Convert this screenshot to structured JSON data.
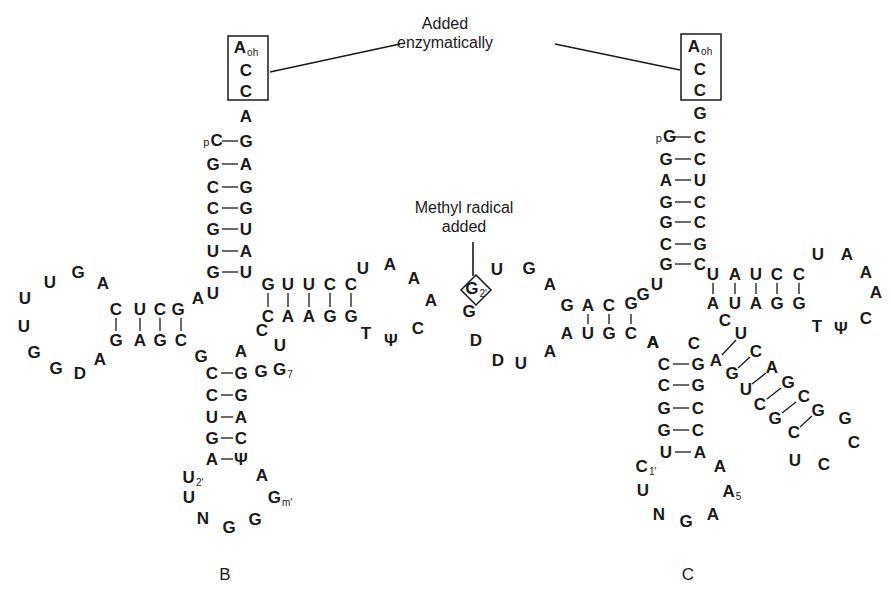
{
  "annotations": {
    "enzymatic": {
      "line1": "Added",
      "line2": "enzymatically",
      "x": 445,
      "y": 14
    },
    "methyl": {
      "line1": "Methyl radical",
      "line2": "added",
      "x": 464,
      "y": 198
    }
  },
  "panels": {
    "B": {
      "label": "B",
      "x": 225,
      "y": 575
    },
    "C": {
      "label": "C",
      "x": 688,
      "y": 575
    }
  },
  "boxes": [
    {
      "name": "enzymatic-box-B",
      "x": 228,
      "y": 36,
      "w": 40,
      "h": 64
    },
    {
      "name": "enzymatic-box-C",
      "x": 681,
      "y": 34,
      "w": 40,
      "h": 66
    }
  ],
  "nucleotides": [
    {
      "t": "A",
      "sub": "oh",
      "x": 246,
      "y": 48
    },
    {
      "t": "C",
      "x": 246,
      "y": 70
    },
    {
      "t": "C",
      "x": 246,
      "y": 91
    },
    {
      "t": "A",
      "x": 246,
      "y": 116
    },
    {
      "t": "C",
      "pre": "p",
      "x": 213,
      "y": 141
    },
    {
      "t": "G",
      "x": 246,
      "y": 141
    },
    {
      "t": "G",
      "x": 213,
      "y": 164
    },
    {
      "t": "A",
      "x": 246,
      "y": 164
    },
    {
      "t": "C",
      "x": 213,
      "y": 187
    },
    {
      "t": "G",
      "x": 246,
      "y": 187
    },
    {
      "t": "C",
      "x": 213,
      "y": 208
    },
    {
      "t": "G",
      "x": 246,
      "y": 208
    },
    {
      "t": "G",
      "x": 213,
      "y": 229
    },
    {
      "t": "U",
      "x": 246,
      "y": 229
    },
    {
      "t": "U",
      "x": 213,
      "y": 251
    },
    {
      "t": "A",
      "x": 246,
      "y": 251
    },
    {
      "t": "G",
      "x": 213,
      "y": 272
    },
    {
      "t": "U",
      "x": 246,
      "y": 272
    },
    {
      "t": "U",
      "x": 213,
      "y": 293
    },
    {
      "t": "A",
      "x": 198,
      "y": 298
    },
    {
      "t": "G",
      "x": 178,
      "y": 309
    },
    {
      "t": "C",
      "x": 160,
      "y": 309
    },
    {
      "t": "U",
      "x": 140,
      "y": 309
    },
    {
      "t": "C",
      "x": 116,
      "y": 309
    },
    {
      "t": "A",
      "x": 103,
      "y": 283
    },
    {
      "t": "G",
      "x": 78,
      "y": 272
    },
    {
      "t": "U",
      "x": 50,
      "y": 282
    },
    {
      "t": "U",
      "x": 25,
      "y": 298
    },
    {
      "t": "U",
      "x": 24,
      "y": 326
    },
    {
      "t": "G",
      "x": 34,
      "y": 352
    },
    {
      "t": "G",
      "x": 56,
      "y": 368
    },
    {
      "t": "D",
      "x": 80,
      "y": 373
    },
    {
      "t": "A",
      "x": 100,
      "y": 359
    },
    {
      "t": "G",
      "x": 116,
      "y": 340
    },
    {
      "t": "A",
      "x": 140,
      "y": 340
    },
    {
      "t": "G",
      "x": 160,
      "y": 340
    },
    {
      "t": "C",
      "x": 181,
      "y": 340
    },
    {
      "t": "G",
      "x": 201,
      "y": 356
    },
    {
      "t": "C",
      "x": 212,
      "y": 373
    },
    {
      "t": "A",
      "x": 241,
      "y": 351
    },
    {
      "t": "G",
      "x": 241,
      "y": 373
    },
    {
      "t": "G",
      "x": 261,
      "y": 371
    },
    {
      "t": "G",
      "sub": "7",
      "x": 283,
      "y": 370
    },
    {
      "t": "C",
      "x": 212,
      "y": 395
    },
    {
      "t": "G",
      "x": 241,
      "y": 395
    },
    {
      "t": "U",
      "x": 212,
      "y": 417
    },
    {
      "t": "A",
      "x": 241,
      "y": 417
    },
    {
      "t": "G",
      "x": 212,
      "y": 438
    },
    {
      "t": "C",
      "x": 241,
      "y": 438
    },
    {
      "t": "A",
      "x": 212,
      "y": 459
    },
    {
      "t": "Ψ",
      "x": 241,
      "y": 459
    },
    {
      "t": "U",
      "sub": "2'",
      "x": 193,
      "y": 478
    },
    {
      "t": "A",
      "x": 262,
      "y": 475
    },
    {
      "t": "U",
      "x": 189,
      "y": 497
    },
    {
      "t": "G",
      "sub": "m'",
      "x": 280,
      "y": 498
    },
    {
      "t": "N",
      "x": 203,
      "y": 518
    },
    {
      "t": "G",
      "x": 229,
      "y": 527
    },
    {
      "t": "G",
      "x": 255,
      "y": 519
    },
    {
      "t": "G",
      "x": 268,
      "y": 284
    },
    {
      "t": "U",
      "x": 288,
      "y": 284
    },
    {
      "t": "U",
      "x": 309,
      "y": 284
    },
    {
      "t": "C",
      "x": 330,
      "y": 284
    },
    {
      "t": "C",
      "x": 351,
      "y": 284
    },
    {
      "t": "U",
      "x": 363,
      "y": 268
    },
    {
      "t": "A",
      "x": 390,
      "y": 264
    },
    {
      "t": "A",
      "x": 414,
      "y": 278
    },
    {
      "t": "A",
      "x": 431,
      "y": 300
    },
    {
      "t": "C",
      "x": 418,
      "y": 328
    },
    {
      "t": "C",
      "x": 268,
      "y": 316
    },
    {
      "t": "A",
      "x": 288,
      "y": 316
    },
    {
      "t": "A",
      "x": 309,
      "y": 316
    },
    {
      "t": "G",
      "x": 330,
      "y": 316
    },
    {
      "t": "G",
      "x": 351,
      "y": 316
    },
    {
      "t": "C",
      "x": 262,
      "y": 330
    },
    {
      "t": "U",
      "x": 280,
      "y": 345
    },
    {
      "t": "T",
      "x": 366,
      "y": 333
    },
    {
      "t": "Ψ",
      "x": 391,
      "y": 340
    },
    {
      "t": "U",
      "x": 497,
      "y": 269
    },
    {
      "t": "G",
      "x": 529,
      "y": 268
    },
    {
      "t": "A",
      "x": 550,
      "y": 284
    },
    {
      "t": "G",
      "sub": "2'",
      "x": 476,
      "y": 289
    },
    {
      "t": "G",
      "x": 469,
      "y": 311
    },
    {
      "t": "D",
      "x": 476,
      "y": 340
    },
    {
      "t": "D",
      "x": 498,
      "y": 360
    },
    {
      "t": "U",
      "x": 521,
      "y": 363
    },
    {
      "t": "A",
      "x": 550,
      "y": 351
    },
    {
      "t": "G",
      "x": 567,
      "y": 305
    },
    {
      "t": "A",
      "x": 588,
      "y": 305
    },
    {
      "t": "C",
      "x": 609,
      "y": 305
    },
    {
      "t": "G",
      "x": 631,
      "y": 303
    },
    {
      "t": "G",
      "x": 643,
      "y": 294
    },
    {
      "t": "U",
      "x": 657,
      "y": 284
    },
    {
      "t": "A",
      "x": 567,
      "y": 333
    },
    {
      "t": "U",
      "x": 588,
      "y": 333
    },
    {
      "t": "G",
      "x": 609,
      "y": 333
    },
    {
      "t": "C",
      "x": 631,
      "y": 333
    },
    {
      "t": "A",
      "x": 653,
      "y": 342
    },
    {
      "t": "A",
      "sub": "oh",
      "x": 700,
      "y": 47
    },
    {
      "t": "C",
      "x": 700,
      "y": 69
    },
    {
      "t": "C",
      "x": 700,
      "y": 90
    },
    {
      "t": "G",
      "x": 700,
      "y": 113
    },
    {
      "t": "G",
      "pre": "p",
      "x": 666,
      "y": 137
    },
    {
      "t": "C",
      "x": 700,
      "y": 137
    },
    {
      "t": "G",
      "x": 666,
      "y": 159
    },
    {
      "t": "C",
      "x": 700,
      "y": 159
    },
    {
      "t": "A",
      "x": 666,
      "y": 180
    },
    {
      "t": "U",
      "x": 700,
      "y": 180
    },
    {
      "t": "G",
      "x": 666,
      "y": 202
    },
    {
      "t": "C",
      "x": 700,
      "y": 202
    },
    {
      "t": "G",
      "x": 666,
      "y": 222
    },
    {
      "t": "C",
      "x": 700,
      "y": 222
    },
    {
      "t": "C",
      "x": 666,
      "y": 244
    },
    {
      "t": "G",
      "x": 700,
      "y": 244
    },
    {
      "t": "G",
      "x": 666,
      "y": 264
    },
    {
      "t": "C",
      "x": 700,
      "y": 264
    },
    {
      "t": "U",
      "x": 713,
      "y": 274
    },
    {
      "t": "A",
      "x": 735,
      "y": 274
    },
    {
      "t": "U",
      "x": 756,
      "y": 274
    },
    {
      "t": "C",
      "x": 777,
      "y": 274
    },
    {
      "t": "C",
      "x": 799,
      "y": 274
    },
    {
      "t": "U",
      "x": 818,
      "y": 254
    },
    {
      "t": "A",
      "x": 847,
      "y": 254
    },
    {
      "t": "A",
      "x": 866,
      "y": 272
    },
    {
      "t": "A",
      "x": 876,
      "y": 292
    },
    {
      "t": "C",
      "x": 866,
      "y": 318
    },
    {
      "t": "A",
      "x": 713,
      "y": 303
    },
    {
      "t": "U",
      "x": 735,
      "y": 303
    },
    {
      "t": "A",
      "x": 756,
      "y": 303
    },
    {
      "t": "G",
      "x": 777,
      "y": 303
    },
    {
      "t": "G",
      "x": 799,
      "y": 303
    },
    {
      "t": "T",
      "x": 817,
      "y": 326
    },
    {
      "t": "Ψ",
      "x": 841,
      "y": 328
    },
    {
      "t": "C",
      "x": 725,
      "y": 320
    },
    {
      "t": "A",
      "x": 653,
      "y": 342
    },
    {
      "t": "C",
      "x": 694,
      "y": 343
    },
    {
      "t": "C",
      "x": 664,
      "y": 364
    },
    {
      "t": "G",
      "x": 698,
      "y": 364
    },
    {
      "t": "C",
      "x": 664,
      "y": 385
    },
    {
      "t": "G",
      "x": 698,
      "y": 385
    },
    {
      "t": "G",
      "x": 664,
      "y": 408
    },
    {
      "t": "C",
      "x": 698,
      "y": 408
    },
    {
      "t": "G",
      "x": 664,
      "y": 430
    },
    {
      "t": "C",
      "x": 698,
      "y": 430
    },
    {
      "t": "U",
      "x": 666,
      "y": 452
    },
    {
      "t": "A",
      "x": 700,
      "y": 452
    },
    {
      "t": "C",
      "sub": "1'",
      "x": 646,
      "y": 467
    },
    {
      "t": "A",
      "x": 720,
      "y": 466
    },
    {
      "t": "U",
      "x": 643,
      "y": 490
    },
    {
      "t": "A",
      "sub": "5",
      "x": 732,
      "y": 492
    },
    {
      "t": "N",
      "x": 659,
      "y": 514
    },
    {
      "t": "G",
      "x": 686,
      "y": 521
    },
    {
      "t": "A",
      "x": 713,
      "y": 514
    },
    {
      "t": "U",
      "x": 741,
      "y": 333
    },
    {
      "t": "A",
      "x": 716,
      "y": 360
    },
    {
      "t": "C",
      "x": 756,
      "y": 351
    },
    {
      "t": "G",
      "x": 732,
      "y": 373
    },
    {
      "t": "A",
      "x": 772,
      "y": 367
    },
    {
      "t": "U",
      "x": 746,
      "y": 389
    },
    {
      "t": "G",
      "x": 788,
      "y": 382
    },
    {
      "t": "C",
      "x": 760,
      "y": 404
    },
    {
      "t": "C",
      "x": 804,
      "y": 396
    },
    {
      "t": "G",
      "x": 775,
      "y": 418
    },
    {
      "t": "G",
      "x": 818,
      "y": 410
    },
    {
      "t": "C",
      "x": 794,
      "y": 432
    },
    {
      "t": "G",
      "x": 845,
      "y": 418
    },
    {
      "t": "C",
      "x": 854,
      "y": 442
    },
    {
      "t": "U",
      "x": 795,
      "y": 460
    },
    {
      "t": "C",
      "x": 824,
      "y": 464
    }
  ],
  "pair_lines": [
    [
      222,
      141,
      238,
      141
    ],
    [
      222,
      164,
      238,
      164
    ],
    [
      222,
      187,
      238,
      187
    ],
    [
      222,
      208,
      238,
      208
    ],
    [
      222,
      229,
      238,
      229
    ],
    [
      222,
      251,
      238,
      251
    ],
    [
      222,
      272,
      238,
      272
    ],
    [
      116,
      318,
      116,
      331
    ],
    [
      140,
      318,
      140,
      331
    ],
    [
      160,
      318,
      160,
      331
    ],
    [
      181,
      318,
      181,
      331
    ],
    [
      221,
      373,
      233,
      373
    ],
    [
      221,
      395,
      233,
      395
    ],
    [
      221,
      417,
      233,
      417
    ],
    [
      221,
      438,
      233,
      438
    ],
    [
      221,
      459,
      233,
      459
    ],
    [
      268,
      293,
      268,
      307
    ],
    [
      288,
      293,
      288,
      307
    ],
    [
      309,
      293,
      309,
      307
    ],
    [
      330,
      293,
      330,
      307
    ],
    [
      351,
      293,
      351,
      307
    ],
    [
      588,
      314,
      588,
      324
    ],
    [
      609,
      314,
      609,
      324
    ],
    [
      631,
      314,
      631,
      324
    ],
    [
      675,
      137,
      691,
      137
    ],
    [
      675,
      159,
      691,
      159
    ],
    [
      675,
      180,
      691,
      180
    ],
    [
      675,
      202,
      691,
      202
    ],
    [
      675,
      222,
      691,
      222
    ],
    [
      675,
      244,
      691,
      244
    ],
    [
      675,
      264,
      691,
      264
    ],
    [
      713,
      283,
      713,
      294
    ],
    [
      735,
      283,
      735,
      294
    ],
    [
      756,
      283,
      756,
      294
    ],
    [
      777,
      283,
      777,
      294
    ],
    [
      799,
      283,
      799,
      294
    ],
    [
      673,
      364,
      689,
      364
    ],
    [
      673,
      385,
      689,
      385
    ],
    [
      673,
      408,
      689,
      408
    ],
    [
      673,
      430,
      689,
      430
    ],
    [
      675,
      452,
      691,
      452
    ],
    [
      722,
      355,
      736,
      340
    ],
    [
      738,
      368,
      750,
      357
    ],
    [
      752,
      384,
      766,
      373
    ],
    [
      767,
      399,
      781,
      388
    ],
    [
      782,
      413,
      796,
      402
    ],
    [
      800,
      427,
      812,
      416
    ]
  ],
  "connector_lines": [
    [
      270,
      72,
      400,
      44
    ],
    [
      555,
      44,
      680,
      70
    ],
    [
      473,
      242,
      473,
      276
    ]
  ],
  "diamond": {
    "cx": 476,
    "cy": 290,
    "r": 15
  }
}
